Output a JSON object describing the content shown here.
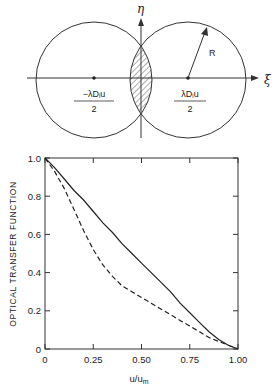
{
  "diagram": {
    "axis_labels": {
      "vertical": "η",
      "horizontal": "ξ"
    },
    "radius_label": "R",
    "left_center_label": {
      "numerator": "−λDᵢu",
      "denominator": "2"
    },
    "right_center_label": {
      "numerator": "λDᵢu",
      "denominator": "2"
    }
  },
  "chart_data": {
    "type": "line",
    "title": "",
    "xlabel": "u/u_m",
    "xlabel_main": "u/u",
    "xlabel_sub": "m",
    "ylabel": "OPTICAL TRANSFER FUNCTION",
    "xlim": [
      0,
      1.0
    ],
    "ylim": [
      0,
      1.0
    ],
    "x_ticks": [
      "0",
      "0.25",
      "0.50",
      "0.75",
      "1.00"
    ],
    "y_ticks": [
      "0",
      "0.2",
      "0.4",
      "0.6",
      "0.8",
      "1.0"
    ],
    "grid": false,
    "series": [
      {
        "name": "solid",
        "style": "solid",
        "x": [
          0,
          0.05,
          0.1,
          0.15,
          0.2,
          0.25,
          0.3,
          0.35,
          0.4,
          0.45,
          0.5,
          0.55,
          0.6,
          0.65,
          0.7,
          0.75,
          0.8,
          0.85,
          0.9,
          0.95,
          1.0
        ],
        "values": [
          1.0,
          0.95,
          0.89,
          0.83,
          0.78,
          0.72,
          0.66,
          0.61,
          0.55,
          0.5,
          0.45,
          0.4,
          0.35,
          0.3,
          0.24,
          0.19,
          0.14,
          0.09,
          0.05,
          0.02,
          0.0
        ]
      },
      {
        "name": "dashed",
        "style": "dashed",
        "x": [
          0,
          0.05,
          0.1,
          0.15,
          0.2,
          0.25,
          0.3,
          0.35,
          0.4,
          0.45,
          0.5,
          0.55,
          0.6,
          0.65,
          0.7,
          0.75,
          0.8,
          0.85,
          0.9,
          0.95,
          1.0
        ],
        "values": [
          1.0,
          0.93,
          0.84,
          0.73,
          0.62,
          0.52,
          0.44,
          0.38,
          0.33,
          0.3,
          0.27,
          0.24,
          0.21,
          0.18,
          0.15,
          0.12,
          0.09,
          0.06,
          0.04,
          0.02,
          0.0
        ]
      }
    ]
  }
}
